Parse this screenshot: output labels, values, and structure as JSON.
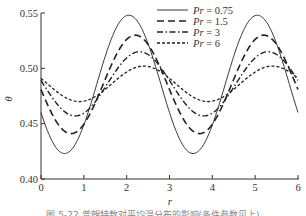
{
  "chart_data": {
    "type": "line",
    "title": "",
    "xlabel": "r",
    "ylabel": "θ",
    "xlim": [
      0,
      6
    ],
    "ylim": [
      0.4,
      0.55
    ],
    "xticks": [
      "0",
      "1",
      "2",
      "3",
      "4",
      "5",
      "6"
    ],
    "yticks": [
      "0.40",
      "0.45",
      "0.50",
      "0.55"
    ],
    "grid": false,
    "legend_position": "top-center",
    "x": [
      0,
      0.5,
      1.0,
      1.5,
      2.0,
      2.5,
      3.0,
      3.5,
      4.0,
      4.5,
      5.0,
      5.5,
      6.0
    ],
    "series": [
      {
        "name": "Pr = 0.75",
        "style": "solid",
        "mean": 0.4855,
        "amplitude": 0.0625,
        "period": 3.0,
        "peak_r": 2.05,
        "values": [
          0.46,
          0.423,
          0.44,
          0.493,
          0.548,
          0.529,
          0.479,
          0.423,
          0.443,
          0.497,
          0.548,
          0.526,
          0.462
        ]
      },
      {
        "name": "Pr = 1.5",
        "style": "dashed",
        "mean": 0.4855,
        "amplitude": 0.0445,
        "period": 3.0,
        "peak_r": 2.2,
        "values": [
          0.479,
          0.443,
          0.444,
          0.48,
          0.525,
          0.527,
          0.492,
          0.447,
          0.443,
          0.478,
          0.524,
          0.528,
          0.49
        ]
      },
      {
        "name": "Pr = 3",
        "style": "dash-dot",
        "mean": 0.486,
        "amplitude": 0.029,
        "period": 3.0,
        "peak_r": 2.3,
        "values": [
          0.487,
          0.459,
          0.457,
          0.476,
          0.506,
          0.514,
          0.496,
          0.466,
          0.457,
          0.474,
          0.504,
          0.515,
          0.498
        ]
      },
      {
        "name": "Pr = 6",
        "style": "dotted",
        "mean": 0.486,
        "amplitude": 0.016,
        "period": 3.0,
        "peak_r": 2.4,
        "values": [
          0.49,
          0.474,
          0.47,
          0.478,
          0.495,
          0.502,
          0.496,
          0.479,
          0.47,
          0.475,
          0.492,
          0.502,
          0.497
        ]
      }
    ]
  },
  "legend": [
    {
      "prefix": "Pr",
      "value": " = 0.75"
    },
    {
      "prefix": "Pr",
      "value": " = 1.5"
    },
    {
      "prefix": "Pr",
      "value": " = 3"
    },
    {
      "prefix": "Pr",
      "value": " = 6"
    }
  ],
  "axes": {
    "xlabel": "r",
    "ylabel": "θ"
  },
  "caption": "图 5-22   普朗特数对平均温分布的影响(条件参数见上)"
}
